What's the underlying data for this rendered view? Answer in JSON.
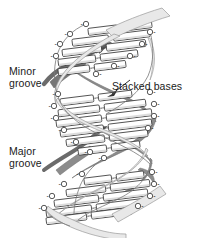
{
  "figure": {
    "background_color": "#ffffff",
    "width": 199,
    "height": 238
  },
  "labels": {
    "minor_groove": "Minor\ngroove",
    "major_groove": "Major\ngroove",
    "stacked_bases": "Stacked bases"
  },
  "colors": {
    "ribbon_front": "#e8e8e8",
    "ribbon_back": "#8c8c8c",
    "ribbon_outline": "#6f6f6f",
    "base_fill": "#ffffff",
    "base_fill_shaded": "#dcdcdc",
    "base_outline": "#333333",
    "phosphate_fill": "#ffffff",
    "phosphate_outline": "#444444",
    "text": "#1a1a1a",
    "arrow_dark": "#6b6b6b",
    "leader_line": "#333333"
  },
  "structure": {
    "type": "dna-double-helix",
    "strand_count": 2,
    "helix_turns": 3,
    "base_pair_rungs": 16,
    "phosphate_charge_symbol": "-",
    "hydrogen_bond_marker": "..",
    "grooves": [
      "minor groove",
      "major groove"
    ],
    "strand_direction_arrows": 2
  },
  "base_pairs": [
    {
      "index": 0,
      "y": 28,
      "x_left": 88,
      "x_right": 152,
      "tilt": -7
    },
    {
      "index": 1,
      "y": 38,
      "x_left": 72,
      "x_right": 150,
      "tilt": -7
    },
    {
      "index": 2,
      "y": 48,
      "x_left": 62,
      "x_right": 146,
      "tilt": -7
    },
    {
      "index": 3,
      "y": 58,
      "x_left": 58,
      "x_right": 138,
      "tilt": -7
    },
    {
      "index": 4,
      "y": 68,
      "x_left": 58,
      "x_right": 126,
      "tilt": -7
    },
    {
      "index": 5,
      "y": 98,
      "x_left": 60,
      "x_right": 132,
      "tilt": -7
    },
    {
      "index": 6,
      "y": 108,
      "x_left": 58,
      "x_right": 146,
      "tilt": -7
    },
    {
      "index": 7,
      "y": 118,
      "x_left": 56,
      "x_right": 152,
      "tilt": -7
    },
    {
      "index": 8,
      "y": 128,
      "x_left": 60,
      "x_right": 152,
      "tilt": -7
    },
    {
      "index": 9,
      "y": 138,
      "x_left": 66,
      "x_right": 148,
      "tilt": -7
    },
    {
      "index": 10,
      "y": 148,
      "x_left": 78,
      "x_right": 140,
      "tilt": -7
    },
    {
      "index": 11,
      "y": 178,
      "x_left": 84,
      "x_right": 144,
      "tilt": -7
    },
    {
      "index": 12,
      "y": 188,
      "x_left": 66,
      "x_right": 150,
      "tilt": -7
    },
    {
      "index": 13,
      "y": 198,
      "x_left": 54,
      "x_right": 148,
      "tilt": -7
    },
    {
      "index": 14,
      "y": 208,
      "x_left": 46,
      "x_right": 142,
      "tilt": -7
    },
    {
      "index": 15,
      "y": 216,
      "x_left": 46,
      "x_right": 132,
      "tilt": -7
    }
  ],
  "phosphates_left": [
    {
      "x": 86,
      "y": 24
    },
    {
      "x": 70,
      "y": 34
    },
    {
      "x": 60,
      "y": 44
    },
    {
      "x": 56,
      "y": 56
    },
    {
      "x": 58,
      "y": 94
    },
    {
      "x": 54,
      "y": 106
    },
    {
      "x": 56,
      "y": 118
    },
    {
      "x": 64,
      "y": 130
    },
    {
      "x": 76,
      "y": 142
    },
    {
      "x": 90,
      "y": 152
    },
    {
      "x": 104,
      "y": 158
    },
    {
      "x": 82,
      "y": 174
    },
    {
      "x": 64,
      "y": 184
    },
    {
      "x": 52,
      "y": 196
    },
    {
      "x": 44,
      "y": 208
    }
  ],
  "phosphates_right": [
    {
      "x": 150,
      "y": 32
    },
    {
      "x": 142,
      "y": 44
    },
    {
      "x": 130,
      "y": 56
    },
    {
      "x": 114,
      "y": 66
    },
    {
      "x": 96,
      "y": 74
    },
    {
      "x": 150,
      "y": 92
    },
    {
      "x": 154,
      "y": 104
    },
    {
      "x": 154,
      "y": 116
    },
    {
      "x": 148,
      "y": 128
    },
    {
      "x": 152,
      "y": 172
    },
    {
      "x": 154,
      "y": 184
    },
    {
      "x": 150,
      "y": 196
    },
    {
      "x": 138,
      "y": 206
    }
  ]
}
